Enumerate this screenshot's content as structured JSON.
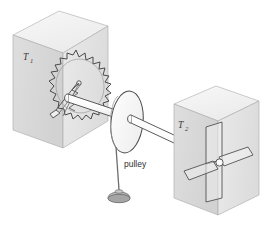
{
  "figure": {
    "labels": {
      "reservoir_left": "T",
      "reservoir_left_sub": "1",
      "reservoir_right": "T",
      "reservoir_right_sub": "2",
      "pulley": "pulley"
    },
    "colors": {
      "background": "#ffffff",
      "block_top_face": "#f2f2f2",
      "block_left_face": "#d9d9d9",
      "block_right_face": "#e6e6e6",
      "outline": "#4a4a4a",
      "axle_fill": "#fbfbfb",
      "paddle_fill": "#efefef",
      "weight_fill": "#b8b8b8",
      "string": "#6d6d6d",
      "text": "#3a3a3a"
    },
    "parts": [
      {
        "name": "left-thermal-reservoir-block",
        "kind": "cube"
      },
      {
        "name": "ratchet-wheel",
        "kind": "toothed-wheel",
        "teeth": 22
      },
      {
        "name": "pawl",
        "kind": "spring-pawl"
      },
      {
        "name": "axle-shaft",
        "kind": "cylinder"
      },
      {
        "name": "pulley-disc",
        "kind": "ellipse-disc"
      },
      {
        "name": "string",
        "kind": "line"
      },
      {
        "name": "hanging-weight",
        "kind": "dome"
      },
      {
        "name": "right-thermal-reservoir-block",
        "kind": "cube"
      },
      {
        "name": "paddle-wheel",
        "kind": "four-vane"
      }
    ]
  }
}
